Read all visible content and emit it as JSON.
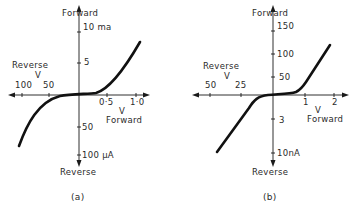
{
  "figure_a": {
    "caption": "(a)",
    "y_top_label": "Forward",
    "y_bottom_label": "Reverse",
    "x_left_label": "Reverse",
    "x_left_unit": "V",
    "x_right_unit": "V",
    "x_right_label": "Forward",
    "y_ticks_forward": [
      "10 ma",
      "5"
    ],
    "y_ticks_reverse": [
      "50",
      "100 μA"
    ],
    "x_ticks_reverse": [
      "100",
      "50"
    ],
    "x_ticks_forward": [
      "0·5",
      "1·0"
    ]
  },
  "figure_b": {
    "caption": "(b)",
    "y_top_label": "Forward",
    "y_bottom_label": "Reverse",
    "x_left_label": "Reverse",
    "x_left_unit": "V",
    "x_right_unit": "V",
    "x_right_label": "Forward",
    "y_ticks_forward": [
      "150",
      "100",
      "50"
    ],
    "y_ticks_reverse": [
      "3",
      "10nA"
    ],
    "x_ticks_reverse": [
      "50",
      "25"
    ],
    "x_ticks_forward": [
      "1",
      "2"
    ]
  },
  "colors": {
    "ink": "#1a1a1a",
    "background": "#ffffff"
  }
}
